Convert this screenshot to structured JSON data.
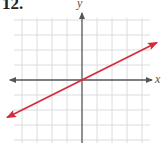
{
  "problem_number": "12.",
  "colors": {
    "grid": "#dcdcdc",
    "axis": "#555555",
    "line": "#d8283a",
    "background": "#ffffff"
  },
  "chart_data": {
    "type": "line",
    "title": "12.",
    "xlabel": "x",
    "ylabel": "y",
    "grid": true,
    "xlim": [
      -5,
      5
    ],
    "ylim": [
      -4,
      5
    ],
    "tick_labels": "none",
    "series": [
      {
        "name": "line",
        "equation": "y = x/2",
        "color": "#d8283a",
        "arrows_both_ends": true,
        "x": [
          -5,
          -4,
          -2,
          0,
          2,
          4,
          5
        ],
        "y": [
          -2.5,
          -2,
          -1,
          0,
          1,
          2,
          2.5
        ]
      }
    ]
  }
}
